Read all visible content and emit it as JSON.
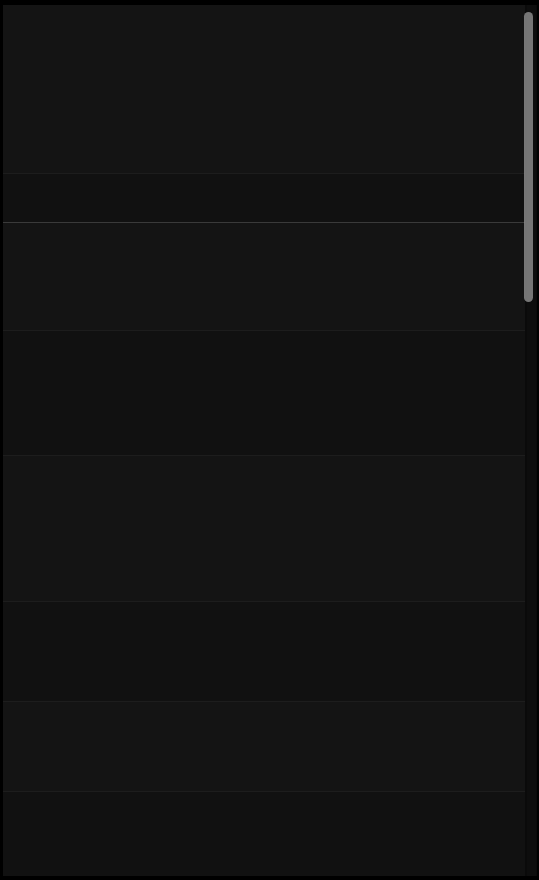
{
  "screen": {
    "width": 539,
    "height": 880,
    "background_color": "#0a0a0a",
    "theme": "dark",
    "description": "Near-black dark-theme scrollable view; content is not legible at any zoom level."
  },
  "viewport": {
    "background_color": "#131313",
    "left": 3,
    "top": 5,
    "width": 522,
    "height": 871
  },
  "dividers": [
    {
      "name": "primary-divider",
      "y": 217,
      "color": "#3a3a3a",
      "weight": "strong"
    },
    {
      "name": "section-divider-1",
      "y": 168,
      "color": "#1d1d1d",
      "weight": "faint"
    },
    {
      "name": "section-divider-2",
      "y": 325,
      "color": "#1d1d1d",
      "weight": "faint"
    },
    {
      "name": "section-divider-3",
      "y": 450,
      "color": "#1d1d1d",
      "weight": "faint"
    },
    {
      "name": "section-divider-4",
      "y": 596,
      "color": "#1d1d1d",
      "weight": "faint"
    },
    {
      "name": "section-divider-5",
      "y": 696,
      "color": "#1d1d1d",
      "weight": "faint"
    },
    {
      "name": "section-divider-6",
      "y": 786,
      "color": "#1d1d1d",
      "weight": "faint"
    }
  ],
  "sections": [
    {
      "name": "section-top",
      "top": 0,
      "height": 168,
      "tone": "base"
    },
    {
      "name": "section-second",
      "top": 169,
      "height": 48,
      "tone": "alt"
    },
    {
      "name": "section-third",
      "top": 218,
      "height": 107,
      "tone": "base"
    },
    {
      "name": "section-fourth",
      "top": 326,
      "height": 124,
      "tone": "alt"
    },
    {
      "name": "section-fifth",
      "top": 451,
      "height": 145,
      "tone": "base"
    },
    {
      "name": "section-sixth",
      "top": 597,
      "height": 99,
      "tone": "alt"
    },
    {
      "name": "section-seventh",
      "top": 697,
      "height": 89,
      "tone": "base"
    },
    {
      "name": "section-eighth",
      "top": 787,
      "height": 84,
      "tone": "alt"
    }
  ],
  "content": {
    "note": "No text is legible in the source screenshot; all glyphs render at effectively zero contrast against the black background.",
    "illegible_lines": [
      {
        "top": 22,
        "left": 16,
        "width": 300,
        "style": "title"
      },
      {
        "top": 48,
        "left": 16,
        "width": 430,
        "style": "body"
      },
      {
        "top": 68,
        "left": 16,
        "width": 400,
        "style": "body"
      },
      {
        "top": 88,
        "left": 16,
        "width": 460,
        "style": "body"
      },
      {
        "top": 108,
        "left": 16,
        "width": 380,
        "style": "body"
      },
      {
        "top": 128,
        "left": 16,
        "width": 440,
        "style": "body"
      },
      {
        "top": 148,
        "left": 16,
        "width": 290,
        "style": "body"
      },
      {
        "top": 182,
        "left": 16,
        "width": 340,
        "style": "body"
      },
      {
        "top": 232,
        "left": 16,
        "width": 410,
        "style": "title"
      },
      {
        "top": 258,
        "left": 16,
        "width": 450,
        "style": "body"
      },
      {
        "top": 278,
        "left": 16,
        "width": 390,
        "style": "body"
      },
      {
        "top": 300,
        "left": 16,
        "width": 330,
        "style": "body"
      },
      {
        "top": 340,
        "left": 16,
        "width": 420,
        "style": "body"
      },
      {
        "top": 362,
        "left": 16,
        "width": 360,
        "style": "body"
      },
      {
        "top": 384,
        "left": 16,
        "width": 440,
        "style": "body"
      },
      {
        "top": 406,
        "left": 16,
        "width": 300,
        "style": "body"
      },
      {
        "top": 428,
        "left": 16,
        "width": 400,
        "style": "body"
      },
      {
        "top": 466,
        "left": 16,
        "width": 450,
        "style": "body"
      },
      {
        "top": 488,
        "left": 16,
        "width": 370,
        "style": "body"
      },
      {
        "top": 510,
        "left": 16,
        "width": 420,
        "style": "body"
      },
      {
        "top": 532,
        "left": 16,
        "width": 340,
        "style": "body"
      },
      {
        "top": 554,
        "left": 16,
        "width": 460,
        "style": "body"
      },
      {
        "top": 576,
        "left": 16,
        "width": 310,
        "style": "body"
      },
      {
        "top": 612,
        "left": 16,
        "width": 430,
        "style": "body"
      },
      {
        "top": 634,
        "left": 16,
        "width": 380,
        "style": "body"
      },
      {
        "top": 656,
        "left": 16,
        "width": 410,
        "style": "body"
      },
      {
        "top": 678,
        "left": 16,
        "width": 320,
        "style": "body"
      },
      {
        "top": 712,
        "left": 16,
        "width": 440,
        "style": "body"
      },
      {
        "top": 734,
        "left": 16,
        "width": 350,
        "style": "body"
      },
      {
        "top": 756,
        "left": 16,
        "width": 400,
        "style": "body"
      },
      {
        "top": 800,
        "left": 16,
        "width": 380,
        "style": "body"
      },
      {
        "top": 822,
        "left": 16,
        "width": 330,
        "style": "body"
      },
      {
        "top": 844,
        "left": 16,
        "width": 290,
        "style": "body"
      }
    ]
  },
  "scrollbar": {
    "orientation": "vertical",
    "track_color": "#0d0d0d",
    "thumb_color": "#8e8e8e",
    "thumb_top": 2,
    "thumb_height": 290,
    "scroll_position": "near-top"
  }
}
